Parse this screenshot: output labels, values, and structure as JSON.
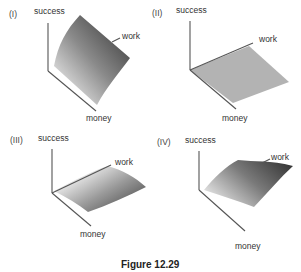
{
  "figure": {
    "caption": "Figure 12.29",
    "panels": [
      {
        "id": "I",
        "label": "(I)",
        "axes": {
          "vertical": "success",
          "right": "work",
          "front": "money"
        },
        "surface": "concave-up rising toward work"
      },
      {
        "id": "II",
        "label": "(II)",
        "axes": {
          "vertical": "success",
          "right": "work",
          "front": "money"
        },
        "surface": "flat plane"
      },
      {
        "id": "III",
        "label": "(III)",
        "axes": {
          "vertical": "success",
          "right": "work",
          "front": "money"
        },
        "surface": "gently curved low surface"
      },
      {
        "id": "IV",
        "label": "(IV)",
        "axes": {
          "vertical": "success",
          "right": "work",
          "front": "money"
        },
        "surface": "saddle-like curving surface"
      }
    ]
  },
  "colors": {
    "axis": "#555555",
    "flat_surface": "#b3b3b3",
    "surface_dark": "#4a4a4a",
    "surface_light": "#e6e6e6"
  }
}
